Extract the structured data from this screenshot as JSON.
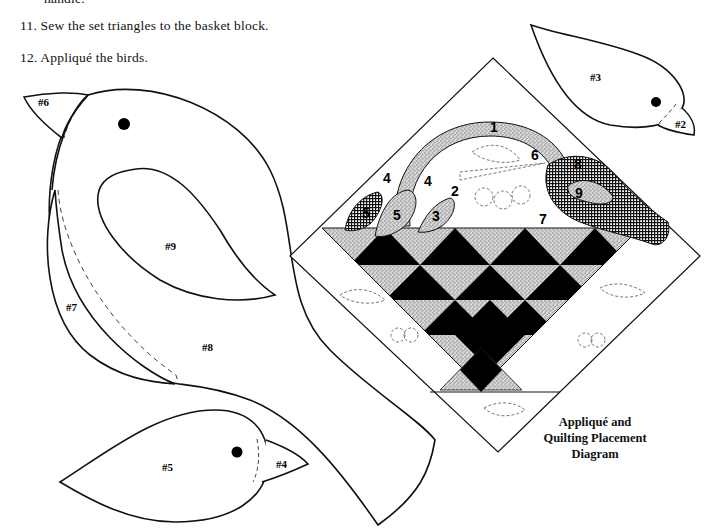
{
  "instructions": {
    "prev_line_fragment": "handle.",
    "steps": [
      {
        "number": "11.",
        "text": "Sew the set triangles to the basket block."
      },
      {
        "number": "12.",
        "text": "Appliqué the birds."
      }
    ]
  },
  "templates": {
    "large_bird": {
      "labels": {
        "beak": "#6",
        "wing": "#9",
        "tail": "#7",
        "body": "#8"
      }
    },
    "small_bird_bottom": {
      "labels": {
        "body": "#5",
        "beak": "#4"
      }
    },
    "small_bird_top_right": {
      "labels": {
        "body": "#3",
        "beak": "#2"
      }
    }
  },
  "diagram": {
    "caption_lines": [
      "Appliqué and",
      "Quilting Placement",
      "Diagram"
    ],
    "placement_numbers": {
      "handle": "1",
      "small_bird_beak": "2",
      "small_bird_body": "3",
      "left_bird_beak_a": "4",
      "left_bird_beak_b": "4",
      "left_bird_body_a": "5",
      "left_bird_body_b": "5",
      "big_bird_beak": "6",
      "big_bird_tail": "7",
      "big_bird_body": "8",
      "big_bird_wing": "9"
    },
    "colors": {
      "dark": "#000000",
      "speckle": "#bdbdbd",
      "background": "#ffffff"
    }
  }
}
